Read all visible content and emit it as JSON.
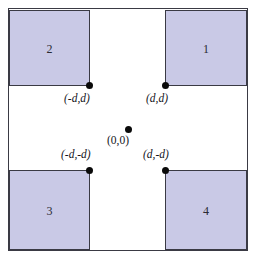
{
  "figure": {
    "title": "",
    "colors": {
      "quadrant_fill": "#c9c9e6",
      "line": "#3a3a44",
      "dot": "#0a0a0a",
      "background": "#ffffff",
      "text": "#15151c"
    },
    "quadrants": [
      {
        "id": "1",
        "label": "1",
        "position": "top-right"
      },
      {
        "id": "2",
        "label": "2",
        "position": "top-left"
      },
      {
        "id": "3",
        "label": "3",
        "position": "bottom-left"
      },
      {
        "id": "4",
        "label": "4",
        "position": "bottom-right"
      }
    ],
    "points": [
      {
        "id": "nd-d",
        "label": "(-d,d)",
        "x": -1,
        "y": 1
      },
      {
        "id": "d-d",
        "label": "(d,d)",
        "x": 1,
        "y": 1
      },
      {
        "id": "origin",
        "label": "(0,0)",
        "x": 0,
        "y": 0
      },
      {
        "id": "nd-nd",
        "label": "(-d,-d)",
        "x": -1,
        "y": -1
      },
      {
        "id": "d-nd",
        "label": "(d,-d)",
        "x": 1,
        "y": -1
      }
    ]
  }
}
